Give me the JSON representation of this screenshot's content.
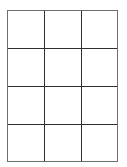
{
  "grid": {
    "rows": 4,
    "columns": 3,
    "cells": [
      [
        "",
        "",
        ""
      ],
      [
        "",
        "",
        ""
      ],
      [
        "",
        "",
        ""
      ],
      [
        "",
        "",
        ""
      ]
    ],
    "colors": {
      "background": "#ffffff",
      "outer_border": "#6e6e6e",
      "inner_lines": "#2e2e2e"
    }
  }
}
